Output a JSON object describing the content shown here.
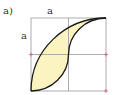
{
  "figure": {
    "part_label": "a)",
    "side_label_top": "a",
    "side_label_left": "a",
    "colors": {
      "fill": "#fbf4c0",
      "curve": "#1a1a1a",
      "grid": "#9a9a9a",
      "marker": "#d9667a",
      "background": "#ffffff"
    },
    "square": {
      "x": 31,
      "y": 18,
      "size": 75
    },
    "markers": [
      {
        "x": 31,
        "y": 54
      },
      {
        "x": 106,
        "y": 54
      },
      {
        "x": 106,
        "y": 91
      }
    ]
  }
}
